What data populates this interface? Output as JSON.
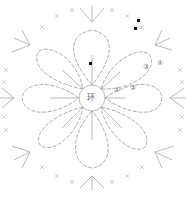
{
  "diagram": {
    "center_label": "环",
    "round_markers": [
      "①",
      "②",
      "③",
      "④"
    ],
    "petal_count": 8,
    "colors": {
      "line": "#9a9a9a",
      "background": "#ffffff",
      "marker": "#111111"
    }
  },
  "caption": "· · · · · · · · · ·"
}
